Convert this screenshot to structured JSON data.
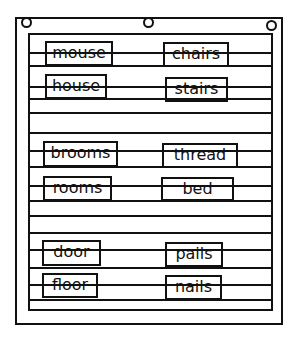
{
  "chart": {
    "holes": [
      {
        "x": 25,
        "y": 21
      },
      {
        "x": 147,
        "y": 21
      },
      {
        "x": 270,
        "y": 24
      }
    ],
    "lines_y": [
      53,
      66,
      87,
      99,
      113,
      133,
      151,
      167,
      186,
      201,
      216,
      233,
      250,
      268,
      285,
      300
    ],
    "cards": [
      {
        "word": "mouse",
        "x": 45,
        "y": 41,
        "w": 68,
        "h": 25
      },
      {
        "word": "chairs",
        "x": 163,
        "y": 42,
        "w": 66,
        "h": 25
      },
      {
        "word": "house",
        "x": 45,
        "y": 74,
        "w": 62,
        "h": 25
      },
      {
        "word": "stairs",
        "x": 165,
        "y": 77,
        "w": 63,
        "h": 25
      },
      {
        "word": "brooms",
        "x": 43,
        "y": 141,
        "w": 75,
        "h": 26
      },
      {
        "word": "thread",
        "x": 162,
        "y": 143,
        "w": 76,
        "h": 25
      },
      {
        "word": "rooms",
        "x": 43,
        "y": 176,
        "w": 69,
        "h": 25
      },
      {
        "word": "bed",
        "x": 161,
        "y": 177,
        "w": 73,
        "h": 24
      },
      {
        "word": "door",
        "x": 42,
        "y": 240,
        "w": 59,
        "h": 26
      },
      {
        "word": "pails",
        "x": 165,
        "y": 242,
        "w": 58,
        "h": 25
      },
      {
        "word": "floor",
        "x": 42,
        "y": 273,
        "w": 56,
        "h": 25
      },
      {
        "word": "nails",
        "x": 165,
        "y": 275,
        "w": 57,
        "h": 25
      }
    ]
  }
}
